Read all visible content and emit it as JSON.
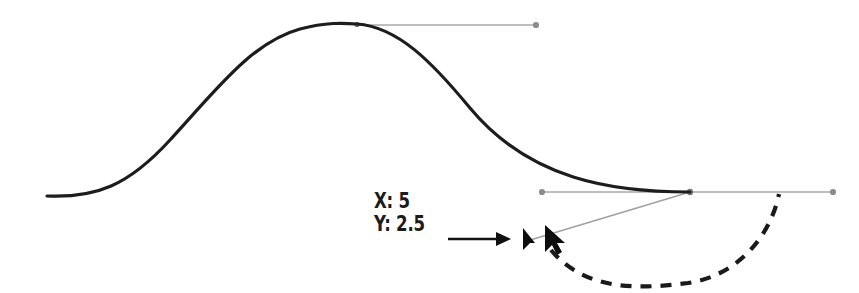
{
  "scene": {
    "title": "Bezier curve handle drag",
    "background_color": "#ffffff",
    "width": 859,
    "height": 293
  },
  "readout": {
    "x_label": "X: 5",
    "y_label": "Y: 2.5",
    "x_value": 5,
    "y_value": 2.5,
    "text_color": "#1b1b1b"
  },
  "colors": {
    "curve": "#1d1d1d",
    "handle_line": "#a8a8a8",
    "handle_dot": "#8c8c8c",
    "annotation_arrow": "#111111",
    "dashed_arrow": "#1a1a1a",
    "cursor": "#0d0d0d"
  },
  "curve": {
    "type": "bezier-s-curve",
    "start": [
      47,
      196
    ],
    "apex": [
      357,
      24
    ],
    "end": [
      690,
      192
    ],
    "stroke_width": 3.2
  },
  "anchors": [
    {
      "name": "upper-anchor",
      "position": [
        357,
        24
      ],
      "handle_out": [
        536,
        25
      ]
    },
    {
      "name": "lower-anchor",
      "position": [
        690,
        192
      ],
      "handle_in": [
        542,
        192
      ],
      "handle_out": [
        833,
        192
      ],
      "handle_dragged": [
        527,
        241
      ]
    }
  ],
  "annotation_arrow": {
    "name": "pointer-arrow",
    "from": [
      448,
      239
    ],
    "to": [
      510,
      239
    ]
  },
  "dashed_arc": {
    "name": "rotation-arc",
    "from": [
      549,
      249
    ],
    "control": [
      665,
      300
    ],
    "to": [
      779,
      193
    ],
    "dash": "11 9",
    "stroke_width": 4.2
  },
  "cursors": [
    {
      "name": "handle-grab-cursor",
      "position": [
        523,
        229
      ]
    },
    {
      "name": "mouse-cursor",
      "position": [
        546,
        227
      ]
    }
  ]
}
